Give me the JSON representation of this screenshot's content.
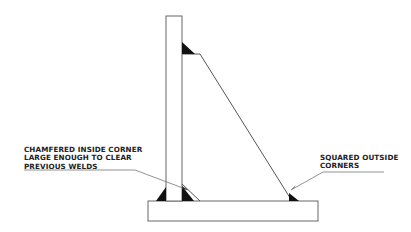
{
  "diagram": {
    "type": "weld-gusset-detail",
    "labels": {
      "left": {
        "lines": [
          "CHAMFERED INSIDE CORNER",
          "LARGE ENOUGH TO CLEAR",
          "PREVIOUS WELDS"
        ]
      },
      "right": {
        "lines": [
          "SQUARED OUTSIDE",
          "CORNERS"
        ]
      }
    },
    "colors": {
      "line": "#555555",
      "weld": "#111111",
      "text": "#222222",
      "background": "#ffffff"
    }
  }
}
